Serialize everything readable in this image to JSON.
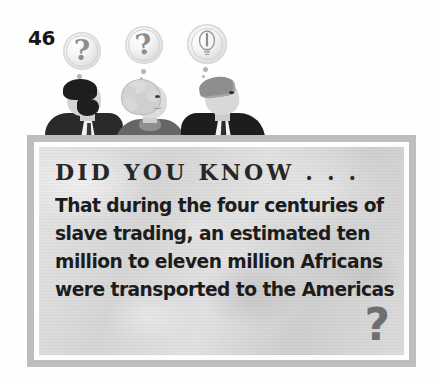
{
  "page": {
    "number": "46"
  },
  "illustration": {
    "name": "three-people-thinking",
    "bubbles": [
      {
        "id": "bubble-1",
        "glyph": "?",
        "icon": "question-mark-thought-bubble"
      },
      {
        "id": "bubble-2",
        "glyph": "?",
        "icon": "question-mark-thought-bubble"
      },
      {
        "id": "bubble-3",
        "glyph": "!",
        "icon": "lightbulb-thought-bubble"
      }
    ],
    "people": [
      {
        "id": "person-1",
        "description": "bearded man in dark suit"
      },
      {
        "id": "person-2",
        "description": "woman with light curly hair"
      },
      {
        "id": "person-3",
        "description": "gray-haired man in dark suit looking up"
      }
    ]
  },
  "know_box": {
    "heading": "DID YOU KNOW . . .",
    "body_lines": [
      "That during the four centuries of",
      "slave trading, an estimated ten",
      "million to eleven million Africans",
      "were transported to the Americas"
    ],
    "trailing_mark": "?"
  },
  "colors": {
    "frame": "#bdbdbd",
    "inner_border": "#fdfdfd",
    "box_fill": "#dedede",
    "heading_text": "#272727",
    "body_text": "#1c1c1c",
    "question_mark": "#6f6f6f",
    "page_number": "#151515"
  }
}
